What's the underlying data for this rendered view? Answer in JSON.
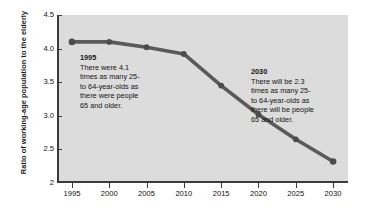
{
  "chart_data": {
    "type": "line",
    "title": "",
    "xlabel": "",
    "ylabel": "Ratio of working-age population to the elderly",
    "x": [
      1995,
      2000,
      2005,
      2010,
      2015,
      2020,
      2025,
      2030
    ],
    "categories": [
      "1995",
      "2000",
      "2005",
      "2010",
      "2015",
      "2020",
      "2025",
      "2030"
    ],
    "values": [
      4.1,
      4.1,
      4.02,
      3.92,
      3.45,
      3.02,
      2.65,
      2.32
    ],
    "series": [
      {
        "name": "Ratio of working-age population to the elderly",
        "values": [
          4.1,
          4.1,
          4.02,
          3.92,
          3.45,
          3.02,
          2.65,
          2.32
        ]
      }
    ],
    "xlim": [
      1993,
      2032
    ],
    "ylim": [
      2.0,
      4.5
    ],
    "y_ticks": [
      "4.5",
      "4.0",
      "3.5",
      "3.0",
      "2.5",
      "2"
    ],
    "y_tick_values": [
      4.5,
      4.0,
      3.5,
      3.0,
      2.5,
      2.0
    ],
    "x_ticks": [
      "1995",
      "2000",
      "2005",
      "2010",
      "2015",
      "2020",
      "2025",
      "2030"
    ],
    "grid": false,
    "legend": "none",
    "line_color": "#5a5a5a",
    "marker_color": "#4c4c4c",
    "plot_background": "#dcdcdc",
    "axis_color": "#3b3b3b",
    "figure_background": "#ffffff"
  },
  "axes": {
    "y_title": "Ratio of working-age population to the elderly"
  },
  "annotations": [
    {
      "id": "1995",
      "title": "1995",
      "body": "There were 4.1\ntimes as many 25-\nto 64-year-olds as\nthere were people\n65 and older."
    },
    {
      "id": "2030",
      "title": "2030",
      "body": "There will be 2.3\ntimes as many 25-\nto 64-year-olds as\nthere will be people\n65 and older."
    }
  ]
}
